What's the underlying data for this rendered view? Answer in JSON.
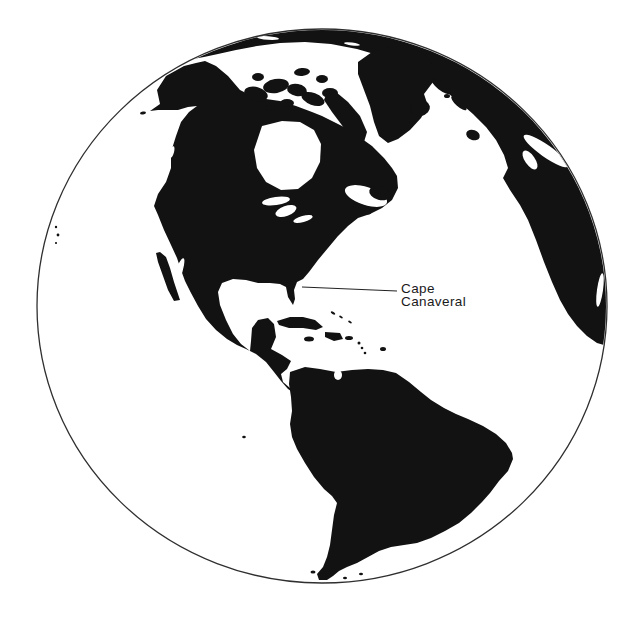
{
  "map": {
    "type": "globe-orthographic-silhouette",
    "description": "Black-and-white globe showing the Western Hemisphere with Cape Canaveral marked",
    "annotation": {
      "line1": "Cape",
      "line2": "Canaveral"
    },
    "leader_line": {
      "x1": 302,
      "y1": 287,
      "x2": 397,
      "y2": 291
    },
    "globe": {
      "cx": 322,
      "cy": 306,
      "rx": 285,
      "ry": 277
    },
    "colors": {
      "land": "#121212",
      "ocean": "#ffffff",
      "globe_outline": "#2f2f2f",
      "label": "#1a1a1a",
      "leader": "#222222"
    },
    "landmasses": [
      "arctic-rim-with-europe-and-africa",
      "north-america",
      "greenland",
      "canadian-arctic-islands",
      "baffin-island",
      "iceland",
      "baja-california",
      "caribbean-islands",
      "south-america",
      "small-pacific-islets"
    ]
  }
}
